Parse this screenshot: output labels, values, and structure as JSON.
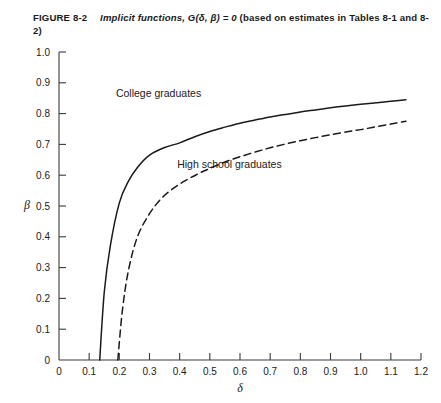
{
  "caption": {
    "figure_label": "FIGURE 8-2",
    "title": "Implicit functions, G(δ, β) = 0",
    "source_note": "(based on estimates in Tables 8-1 and 8-2)",
    "full_text": "FIGURE 8-2   Implicit functions, G(δ, β) = 0 (based on estimates in Tables 8-1 and 8-2)"
  },
  "chart_data": {
    "type": "line",
    "title": "Implicit functions, G(δ, β) = 0",
    "xlabel": "δ",
    "ylabel": "β",
    "xlim": [
      0,
      1.2
    ],
    "ylim": [
      0,
      1.0
    ],
    "xticks": [
      0,
      0.1,
      0.2,
      0.3,
      0.4,
      0.5,
      0.6,
      0.7,
      0.8,
      0.9,
      1.0,
      1.1,
      1.2
    ],
    "xtick_labels": [
      "0",
      "0.1",
      "0.2",
      "0.3",
      "0.4",
      "0.5",
      "0.6",
      "0.7",
      "0.8",
      "0.9",
      "1.0",
      "1.1",
      "1.2"
    ],
    "yticks": [
      0,
      0.1,
      0.2,
      0.3,
      0.4,
      0.5,
      0.6,
      0.7,
      0.8,
      0.9,
      1.0
    ],
    "ytick_labels": [
      "0",
      "0.1",
      "0.2",
      "0.3",
      "0.4",
      "0.5",
      "0.6",
      "0.7",
      "0.8",
      "0.9",
      "1.0"
    ],
    "grid": false,
    "legend_position": "inline-annotations",
    "series": [
      {
        "name": "College graduates",
        "style": "solid",
        "color": "#1a1a1a",
        "label_x": 0.33,
        "label_y": 0.855,
        "x": [
          0.135,
          0.15,
          0.17,
          0.2,
          0.23,
          0.26,
          0.3,
          0.35,
          0.4,
          0.45,
          0.5,
          0.55,
          0.6,
          0.65,
          0.7,
          0.75,
          0.8,
          0.85,
          0.9,
          0.95,
          1.0,
          1.05,
          1.1,
          1.15
        ],
        "y": [
          0.0,
          0.22,
          0.37,
          0.51,
          0.58,
          0.625,
          0.665,
          0.69,
          0.705,
          0.725,
          0.742,
          0.756,
          0.769,
          0.779,
          0.789,
          0.797,
          0.805,
          0.812,
          0.819,
          0.825,
          0.83,
          0.835,
          0.84,
          0.845
        ]
      },
      {
        "name": "High school graduates",
        "style": "dashed",
        "color": "#1a1a1a",
        "label_x": 0.565,
        "label_y": 0.625,
        "x": [
          0.195,
          0.21,
          0.23,
          0.26,
          0.3,
          0.34,
          0.38,
          0.42,
          0.46,
          0.5,
          0.55,
          0.6,
          0.65,
          0.7,
          0.75,
          0.8,
          0.85,
          0.9,
          0.95,
          1.0,
          1.05,
          1.1,
          1.15
        ],
        "y": [
          0.0,
          0.16,
          0.29,
          0.4,
          0.475,
          0.525,
          0.558,
          0.583,
          0.604,
          0.622,
          0.643,
          0.66,
          0.675,
          0.689,
          0.701,
          0.712,
          0.722,
          0.731,
          0.74,
          0.748,
          0.757,
          0.766,
          0.775
        ]
      }
    ]
  }
}
